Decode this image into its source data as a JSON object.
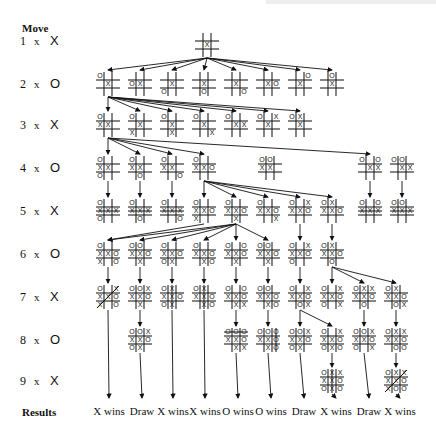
{
  "header": {
    "move_label": "Move",
    "results_label": "Results"
  },
  "rows": [
    {
      "num": "1",
      "x": "x",
      "player": "X",
      "y": 40
    },
    {
      "num": "2",
      "x": "x",
      "player": "O",
      "y": 83
    },
    {
      "num": "3",
      "x": "x",
      "player": "X",
      "y": 124
    },
    {
      "num": "4",
      "x": "x",
      "player": "O",
      "y": 167
    },
    {
      "num": "5",
      "x": "x",
      "player": "X",
      "y": 210
    },
    {
      "num": "6",
      "x": "x",
      "player": "O",
      "y": 253
    },
    {
      "num": "7",
      "x": "x",
      "player": "X",
      "y": 296
    },
    {
      "num": "8",
      "x": "x",
      "player": "O",
      "y": 339
    },
    {
      "num": "9",
      "x": "x",
      "player": "X",
      "y": 380
    }
  ],
  "results": [
    {
      "label": "X wins",
      "x": 109
    },
    {
      "label": "Draw",
      "x": 142
    },
    {
      "label": "X wins",
      "x": 173
    },
    {
      "label": "X wins",
      "x": 205
    },
    {
      "label": "O wins",
      "x": 238
    },
    {
      "label": "O wins",
      "x": 271
    },
    {
      "label": "Draw",
      "x": 304
    },
    {
      "label": "X wins",
      "x": 336
    },
    {
      "label": "Draw",
      "x": 369
    },
    {
      "label": "X wins",
      "x": 400
    }
  ],
  "boards": [
    {
      "id": "r1",
      "x": 195,
      "y": 33,
      "cells": "    X    "
    },
    {
      "id": "r2a",
      "x": 96,
      "y": 72,
      "cells": "O   X    "
    },
    {
      "id": "r2b",
      "x": 128,
      "y": 72,
      "cells": "   OX    "
    },
    {
      "id": "r2c",
      "x": 160,
      "y": 72,
      "cells": "    X O  "
    },
    {
      "id": "r2d",
      "x": 192,
      "y": 72,
      "cells": "    X  O "
    },
    {
      "id": "r2e",
      "x": 224,
      "y": 72,
      "cells": "    X   O"
    },
    {
      "id": "r2f",
      "x": 256,
      "y": 72,
      "cells": "    XO   "
    },
    {
      "id": "r2g",
      "x": 288,
      "y": 72,
      "cells": "  O X    "
    },
    {
      "id": "r2h",
      "x": 320,
      "y": 72,
      "cells": " O  X    "
    },
    {
      "id": "r3a",
      "x": 96,
      "y": 113,
      "cells": "O  XX    "
    },
    {
      "id": "r3b",
      "x": 128,
      "y": 113,
      "cells": "O   X X  "
    },
    {
      "id": "r3c",
      "x": 160,
      "y": 113,
      "cells": "O   X  X "
    },
    {
      "id": "r3d",
      "x": 192,
      "y": 113,
      "cells": "O   X   X"
    },
    {
      "id": "r3e",
      "x": 224,
      "y": 113,
      "cells": "O   XX   "
    },
    {
      "id": "r3f",
      "x": 256,
      "y": 113,
      "cells": "O X X    "
    },
    {
      "id": "r3g",
      "x": 288,
      "y": 113,
      "cells": "OX  X    "
    },
    {
      "id": "r4a",
      "x": 96,
      "y": 156,
      "cells": "O  XX O  "
    },
    {
      "id": "r4b",
      "x": 128,
      "y": 156,
      "cells": "O  XX  O "
    },
    {
      "id": "r4c",
      "x": 160,
      "y": 156,
      "cells": "O  XX   O"
    },
    {
      "id": "r4d",
      "x": 192,
      "y": 156,
      "cells": "O  XXO   "
    },
    {
      "id": "r4e",
      "x": 258,
      "y": 156,
      "cells": "OO XX    "
    },
    {
      "id": "r4f",
      "x": 358,
      "y": 156,
      "cells": "O O XX   "
    },
    {
      "id": "r4g",
      "x": 390,
      "y": 156,
      "cells": "OO  XX   "
    },
    {
      "id": "r5a",
      "x": 96,
      "y": 199,
      "cells": "O  XXXO  ",
      "strike": "row1"
    },
    {
      "id": "r5b",
      "x": 128,
      "y": 199,
      "cells": "O  XXX O ",
      "strike": "row1"
    },
    {
      "id": "r5c",
      "x": 160,
      "y": 199,
      "cells": "O  XXX  O",
      "strike": "row1"
    },
    {
      "id": "r5d",
      "x": 192,
      "y": 199,
      "cells": "O  XXOX  "
    },
    {
      "id": "r5e",
      "x": 224,
      "y": 199,
      "cells": "O  XXO X "
    },
    {
      "id": "r5f",
      "x": 256,
      "y": 199,
      "cells": "O  XXO  X"
    },
    {
      "id": "r5g",
      "x": 288,
      "y": 199,
      "cells": "O XXXO   "
    },
    {
      "id": "r5h",
      "x": 320,
      "y": 199,
      "cells": "OX XXO   "
    },
    {
      "id": "r5i",
      "x": 358,
      "y": 199,
      "cells": "O OXXX   ",
      "strike": "row1"
    },
    {
      "id": "r5j",
      "x": 390,
      "y": 199,
      "cells": "OO XXX   ",
      "strike": "row1"
    },
    {
      "id": "r6a",
      "x": 96,
      "y": 242,
      "cells": "O  XXOX O"
    },
    {
      "id": "r6b",
      "x": 128,
      "y": 242,
      "cells": "OO XXO X "
    },
    {
      "id": "r6c",
      "x": 160,
      "y": 242,
      "cells": "O  XXOOX "
    },
    {
      "id": "r6d",
      "x": 192,
      "y": 242,
      "cells": "O  XXO XO"
    },
    {
      "id": "r6e",
      "x": 224,
      "y": 242,
      "cells": "O OXXO X "
    },
    {
      "id": "r6f",
      "x": 256,
      "y": 242,
      "cells": "OO XXO X "
    },
    {
      "id": "r6g",
      "x": 288,
      "y": 242,
      "cells": "O XXXOO  "
    },
    {
      "id": "r6h",
      "x": 320,
      "y": 242,
      "cells": "OX XXO O "
    },
    {
      "id": "r7a",
      "x": 96,
      "y": 285,
      "cells": "O XXXOX O",
      "strike": "diag2"
    },
    {
      "id": "r7b",
      "x": 128,
      "y": 285,
      "cells": "OOXXXO X "
    },
    {
      "id": "r7c",
      "x": 160,
      "y": 285,
      "cells": "OX XXOOX ",
      "strike": "col1"
    },
    {
      "id": "r7d",
      "x": 192,
      "y": 285,
      "cells": "OX XXO XO",
      "strike": "col1"
    },
    {
      "id": "r7e",
      "x": 224,
      "y": 285,
      "cells": "O OXXO XX"
    },
    {
      "id": "r7f",
      "x": 256,
      "y": 285,
      "cells": "OO XXO XO"
    },
    {
      "id": "r7g",
      "x": 288,
      "y": 285,
      "cells": "O XXXO OX"
    },
    {
      "id": "r7h",
      "x": 320,
      "y": 285,
      "cells": "O XXXOO X"
    },
    {
      "id": "r7i",
      "x": 352,
      "y": 285,
      "cells": "OXXXXO O "
    },
    {
      "id": "r7j",
      "x": 384,
      "y": 285,
      "cells": "OX XXO OX"
    },
    {
      "id": "r8a",
      "x": 128,
      "y": 328,
      "cells": "OOXXXOOX "
    },
    {
      "id": "r8b",
      "x": 224,
      "y": 328,
      "cells": "OOOXXO XX",
      "strike": "row0"
    },
    {
      "id": "r8c",
      "x": 256,
      "y": 328,
      "cells": "OOOXXO XO",
      "strike": "col2"
    },
    {
      "id": "r8d",
      "x": 288,
      "y": 328,
      "cells": "OOXXXOOX "
    },
    {
      "id": "r8e",
      "x": 320,
      "y": 328,
      "cells": "O XXXOOXO"
    },
    {
      "id": "r8f",
      "x": 352,
      "y": 328,
      "cells": "OOXXXOO X"
    },
    {
      "id": "r8g",
      "x": 384,
      "y": 328,
      "cells": "OXXXXO OO"
    },
    {
      "id": "r9a",
      "x": 320,
      "y": 369,
      "cells": "OXXXXOOXO",
      "strike": "col1"
    },
    {
      "id": "r9b",
      "x": 384,
      "y": 369,
      "cells": "OXXXXOXOO",
      "strike": "diag2"
    }
  ],
  "edges": [
    [
      "r1",
      "r2a"
    ],
    [
      "r1",
      "r2b"
    ],
    [
      "r1",
      "r2c"
    ],
    [
      "r1",
      "r2d"
    ],
    [
      "r1",
      "r2e"
    ],
    [
      "r1",
      "r2f"
    ],
    [
      "r1",
      "r2g"
    ],
    [
      "r1",
      "r2h"
    ],
    [
      "r2a",
      "r3a"
    ],
    [
      "r2a",
      "r3b"
    ],
    [
      "r2a",
      "r3c"
    ],
    [
      "r2a",
      "r3d"
    ],
    [
      "r2a",
      "r3e"
    ],
    [
      "r2a",
      "r3f"
    ],
    [
      "r2a",
      "r3g"
    ],
    [
      "r3a",
      "r4a"
    ],
    [
      "r3a",
      "r4b"
    ],
    [
      "r3a",
      "r4c"
    ],
    [
      "r3a",
      "r4d"
    ],
    [
      "r3a",
      "r4f"
    ],
    [
      "r4a",
      "r5a"
    ],
    [
      "r4b",
      "r5b"
    ],
    [
      "r4c",
      "r5c"
    ],
    [
      "r4d",
      "r5d"
    ],
    [
      "r4d",
      "r5e"
    ],
    [
      "r4d",
      "r5f"
    ],
    [
      "r4d",
      "r5g"
    ],
    [
      "r4d",
      "r5h"
    ],
    [
      "r4f",
      "r5i"
    ],
    [
      "r4g",
      "r5j"
    ],
    [
      "r5d",
      "r6a"
    ],
    [
      "r5e",
      "r6a"
    ],
    [
      "r5e",
      "r6b"
    ],
    [
      "r5e",
      "r6c"
    ],
    [
      "r5e",
      "r6d"
    ],
    [
      "r5e",
      "r6e"
    ],
    [
      "r5e",
      "r6f"
    ],
    [
      "r5g",
      "r6g"
    ],
    [
      "r5h",
      "r6h"
    ],
    [
      "r6a",
      "r7a"
    ],
    [
      "r6b",
      "r7b"
    ],
    [
      "r6c",
      "r7c"
    ],
    [
      "r6d",
      "r7d"
    ],
    [
      "r6e",
      "r7e"
    ],
    [
      "r6f",
      "r7f"
    ],
    [
      "r6g",
      "r7g"
    ],
    [
      "r6h",
      "r7h"
    ],
    [
      "r6h",
      "r7i"
    ],
    [
      "r6h",
      "r7j"
    ],
    [
      "r7b",
      "r8a"
    ],
    [
      "r7e",
      "r8b"
    ],
    [
      "r7f",
      "r8c"
    ],
    [
      "r7g",
      "r8d"
    ],
    [
      "r7g",
      "r8e"
    ],
    [
      "r7i",
      "r8f"
    ],
    [
      "r7j",
      "r8g"
    ],
    [
      "r8e",
      "r9a"
    ],
    [
      "r8g",
      "r9b"
    ]
  ],
  "terminal_edges": [
    [
      "r7a",
      0
    ],
    [
      "r8a",
      1
    ],
    [
      "r7c",
      2
    ],
    [
      "r7d",
      3
    ],
    [
      "r8b",
      4
    ],
    [
      "r8c",
      5
    ],
    [
      "r8d",
      6
    ],
    [
      "r9a",
      7
    ],
    [
      "r8f",
      8
    ],
    [
      "r9b",
      9
    ]
  ]
}
